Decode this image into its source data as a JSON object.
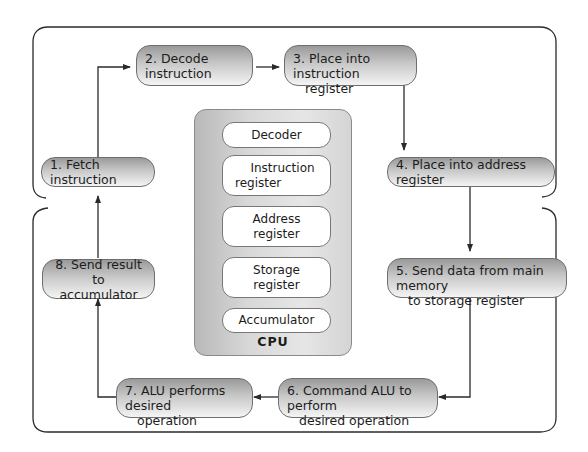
{
  "steps": [
    {
      "id": 1,
      "label": "1. Fetch instruction"
    },
    {
      "id": 2,
      "label": "2. Decode instruction"
    },
    {
      "id": 3,
      "label": "3. Place into instruction",
      "label2": "register"
    },
    {
      "id": 4,
      "label": "4. Place into address register"
    },
    {
      "id": 5,
      "label": "5. Send data from main memory",
      "label2": "to storage register"
    },
    {
      "id": 6,
      "label": "6. Command ALU to perform",
      "label2": "desired operation"
    },
    {
      "id": 7,
      "label": "7. ALU performs desired",
      "label2": "operation"
    },
    {
      "id": 8,
      "label": "8. Send result to",
      "label2": "accumulator"
    }
  ],
  "cpu": {
    "title": "CPU",
    "components": [
      {
        "label": "Decoder"
      },
      {
        "label": "Instruction",
        "label2": "register"
      },
      {
        "label": "Address",
        "label2": "register"
      },
      {
        "label": "Storage",
        "label2": "register"
      },
      {
        "label": "Accumulator"
      }
    ]
  },
  "colors": {
    "line": "#2a2a2a",
    "box_border": "#6e6e6e",
    "box_gradient_top": "#9a9a9a",
    "box_gradient_bottom": "#f4f4f4",
    "cpu_fill": "#d4d4d4"
  }
}
